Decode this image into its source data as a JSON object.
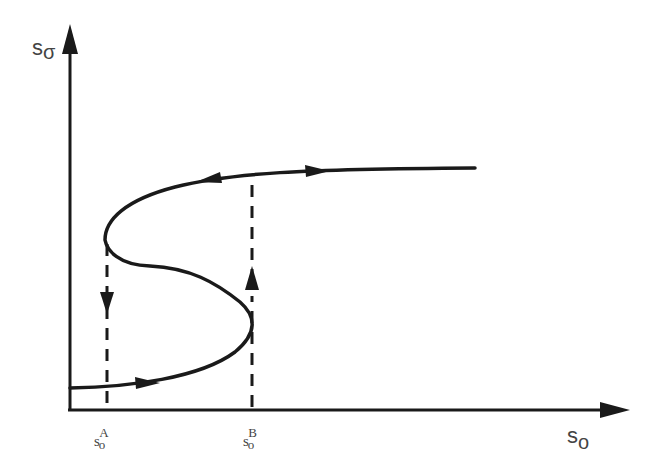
{
  "diagram": {
    "type": "hysteresis S-curve",
    "axes": {
      "y_label": {
        "main": "s",
        "sub": "σ"
      },
      "x_label": {
        "main": "s",
        "sub": "o"
      }
    },
    "ticks": [
      {
        "main": "s",
        "sub": "o",
        "sup": "A"
      },
      {
        "main": "s",
        "sub": "o",
        "sup": "B"
      }
    ],
    "colors": {
      "curve": "#1a1a1a",
      "label": "#444444"
    }
  }
}
